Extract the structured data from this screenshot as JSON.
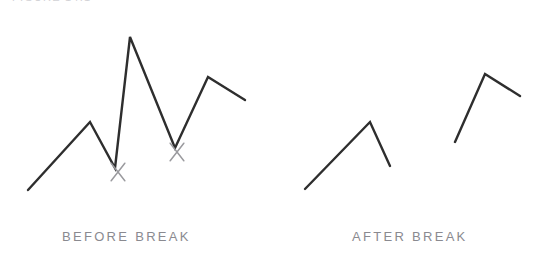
{
  "figure": {
    "clipped_header_text": "FIGURE 14.1",
    "background_color": "#ffffff",
    "line_color": "#2e2e2e",
    "marker_color": "#9a9a9e",
    "caption_color": "#8a8a90"
  },
  "panels": [
    {
      "id": "before-break",
      "caption": "BEFORE BREAK"
    },
    {
      "id": "after-break",
      "caption": "AFTER BREAK"
    }
  ],
  "chart_data": {
    "type": "line",
    "title": "",
    "subtitle": "",
    "xlabel": "",
    "ylabel": "",
    "xlim": [
      0,
      550
    ],
    "ylim": [
      0,
      269
    ],
    "grid": false,
    "legend": "none",
    "axes_visible": false,
    "note": "Two side-by-side schematic zig-zag line panels. Y values are plotted in screen pixel coordinates (smaller y = higher on the page). The left panel shows one continuous polyline with two X markers at its local minima; the right panel shows the same trace split into two disconnected polylines at those break points.",
    "series": [
      {
        "name": "before-break-trace",
        "panel": "before-break",
        "continuous": true,
        "points": [
          {
            "x": 28,
            "y": 190
          },
          {
            "x": 90,
            "y": 122
          },
          {
            "x": 115,
            "y": 168
          },
          {
            "x": 130,
            "y": 37
          },
          {
            "x": 175,
            "y": 148
          },
          {
            "x": 208,
            "y": 77
          },
          {
            "x": 245,
            "y": 100
          }
        ]
      },
      {
        "name": "after-break-segment-1",
        "panel": "after-break",
        "continuous": true,
        "points": [
          {
            "x": 305,
            "y": 189
          },
          {
            "x": 370,
            "y": 122
          },
          {
            "x": 390,
            "y": 166
          }
        ]
      },
      {
        "name": "after-break-segment-2",
        "panel": "after-break",
        "continuous": true,
        "points": [
          {
            "x": 455,
            "y": 142
          },
          {
            "x": 485,
            "y": 74
          },
          {
            "x": 520,
            "y": 96
          }
        ]
      }
    ],
    "annotations": [
      {
        "kind": "x-marker",
        "label": "break-point-1",
        "x": 118,
        "y": 172
      },
      {
        "kind": "x-marker",
        "label": "break-point-2",
        "x": 177,
        "y": 152
      }
    ]
  }
}
